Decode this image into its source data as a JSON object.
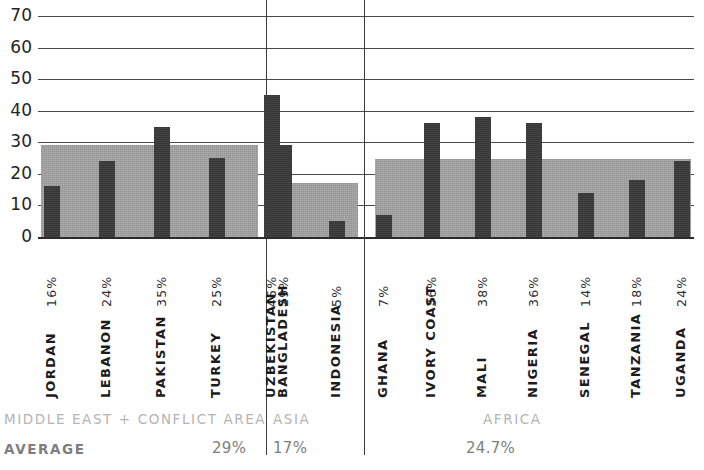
{
  "chart_data": {
    "type": "bar",
    "title": "",
    "xlabel": "",
    "ylabel": "",
    "ylim": [
      0,
      70
    ],
    "y_ticks": [
      0,
      10,
      20,
      30,
      40,
      50,
      60,
      70
    ],
    "grid": true,
    "legend_position": "none",
    "categories": [
      "JORDAN",
      "LEBANON",
      "PAKISTAN",
      "TURKEY",
      "UZBEKISTAN",
      "BANGLADESH",
      "INDONESIA",
      "GHANA",
      "IVORY COAST",
      "MALI",
      "NIGERIA",
      "SENEGAL",
      "TANZANIA",
      "UGANDA"
    ],
    "values": [
      16,
      24,
      35,
      25,
      45,
      29,
      5,
      7,
      36,
      38,
      36,
      14,
      18,
      24
    ],
    "value_labels": [
      "16%",
      "24%",
      "35%",
      "25%",
      "45%",
      "29%",
      "5%",
      "7%",
      "36%",
      "38%",
      "36%",
      "14%",
      "18%",
      "24%"
    ],
    "series": [
      {
        "name": "country share",
        "values": [
          16,
          24,
          35,
          25,
          45,
          29,
          5,
          7,
          36,
          38,
          36,
          14,
          18,
          24
        ]
      }
    ],
    "groups": [
      {
        "name": "MIDDLE EAST + CONFLICT AREA",
        "average": 29,
        "average_label": "29%",
        "members": [
          "JORDAN",
          "LEBANON",
          "PAKISTAN",
          "TURKEY",
          "UZBEKISTAN"
        ]
      },
      {
        "name": "ASIA",
        "average": 17,
        "average_label": "17%",
        "members": [
          "BANGLADESH",
          "INDONESIA"
        ]
      },
      {
        "name": "AFRICA",
        "average": 24.7,
        "average_label": "24.7%",
        "members": [
          "GHANA",
          "IVORY COAST",
          "MALI",
          "NIGERIA",
          "SENEGAL",
          "TANZANIA",
          "UGANDA"
        ]
      }
    ],
    "average_row_label": "AVERAGE",
    "colors": {
      "bar": "#3b3b3b",
      "average_band": "#a3a3a3",
      "gridline": "#4a4a4a",
      "separator": "#3d3d3d",
      "region_text": "#b4b4b4",
      "average_text": "#7e7e7e"
    }
  },
  "y_axis": {
    "ticks": [
      {
        "label": "70",
        "value": 70
      },
      {
        "label": "60",
        "value": 60
      },
      {
        "label": "50",
        "value": 50
      },
      {
        "label": "40",
        "value": 40
      },
      {
        "label": "30",
        "value": 30
      },
      {
        "label": "20",
        "value": 20
      },
      {
        "label": "10",
        "value": 10
      },
      {
        "label": "0",
        "value": 0
      }
    ]
  },
  "bars": [
    {
      "name": "JORDAN",
      "pct": "16%",
      "value": 16,
      "group": 0
    },
    {
      "name": "LEBANON",
      "pct": "24%",
      "value": 24,
      "group": 0
    },
    {
      "name": "PAKISTAN",
      "pct": "35%",
      "value": 35,
      "group": 0
    },
    {
      "name": "TURKEY",
      "pct": "25%",
      "value": 25,
      "group": 0
    },
    {
      "name": "UZBEKISTAN",
      "pct": "45%",
      "value": 45,
      "group": 0
    },
    {
      "name": "BANGLADESH",
      "pct": "29%",
      "value": 29,
      "group": 1
    },
    {
      "name": "INDONESIA",
      "pct": "5%",
      "value": 5,
      "group": 1
    },
    {
      "name": "GHANA",
      "pct": "7%",
      "value": 7,
      "group": 2
    },
    {
      "name": "IVORY COAST",
      "pct": "36%",
      "value": 36,
      "group": 2
    },
    {
      "name": "MALI",
      "pct": "38%",
      "value": 38,
      "group": 2
    },
    {
      "name": "NIGERIA",
      "pct": "36%",
      "value": 36,
      "group": 2
    },
    {
      "name": "SENEGAL",
      "pct": "14%",
      "value": 14,
      "group": 2
    },
    {
      "name": "TANZANIA",
      "pct": "18%",
      "value": 18,
      "group": 2
    },
    {
      "name": "UGANDA",
      "pct": "24%",
      "value": 24,
      "group": 2
    }
  ],
  "footer": {
    "average_word": "AVERAGE",
    "regions": [
      {
        "name": "MIDDLE EAST + CONFLICT AREA",
        "average_label": "29%"
      },
      {
        "name": "ASIA",
        "average_label": "17%"
      },
      {
        "name": "AFRICA",
        "average_label": "24.7%"
      }
    ]
  }
}
